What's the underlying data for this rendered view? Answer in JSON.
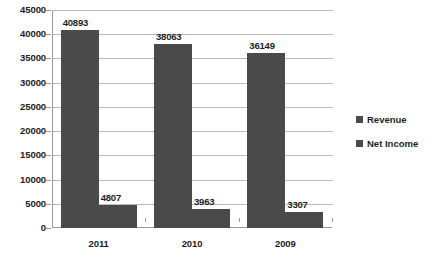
{
  "chart_data": {
    "type": "bar",
    "title": "",
    "xlabel": "",
    "ylabel": "",
    "categories": [
      "2011",
      "2010",
      "2009"
    ],
    "series": [
      {
        "name": "Revenue",
        "values": [
          40893,
          38063,
          36149
        ],
        "color": "#4a4a4a"
      },
      {
        "name": "Net Income",
        "values": [
          4807,
          3963,
          3307
        ],
        "color": "#4a4a4a"
      }
    ],
    "ylim": [
      0,
      45000
    ],
    "ytick_values": [
      0,
      5000,
      10000,
      15000,
      20000,
      25000,
      30000,
      35000,
      40000,
      45000
    ],
    "ytick_labels": [
      "0",
      "5000",
      "10000",
      "15000",
      "20000",
      "25000",
      "30000",
      "35000",
      "40000",
      "45000"
    ],
    "grid": true,
    "grid_color": "#b9b9b9",
    "axis_color": "#9a9a9a",
    "legend_position": "right",
    "data_labels": true,
    "data_label_values": [
      [
        "40893",
        "38063",
        "36149"
      ],
      [
        "4807",
        "3963",
        "3307"
      ]
    ],
    "background": "#ffffff"
  },
  "legend": {
    "items": [
      {
        "label": "Revenue"
      },
      {
        "label": "Net Income"
      }
    ]
  }
}
